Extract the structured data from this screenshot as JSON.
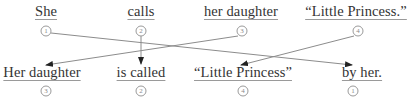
{
  "diagram": {
    "top_row": [
      {
        "text": "She",
        "num": "1",
        "x": 46
      },
      {
        "text": "calls",
        "num": "2",
        "x": 141
      },
      {
        "text": "her daughter",
        "num": "3",
        "x": 241
      },
      {
        "text": "“Little Princess.”",
        "num": "4",
        "x": 356
      }
    ],
    "bottom_row": [
      {
        "text": "Her daughter",
        "num": "3",
        "x": 42
      },
      {
        "text": "is called",
        "num": "2",
        "x": 141
      },
      {
        "text": "“Little Princess”",
        "num": "4",
        "x": 243
      },
      {
        "text": "by her.",
        "num": "1",
        "x": 362
      }
    ],
    "arrows": [
      {
        "from": "1",
        "to": "by her."
      },
      {
        "from": "2",
        "to": "is called"
      },
      {
        "from": "3",
        "to": "Her daughter"
      },
      {
        "from": "4",
        "to": "“Little Princess”"
      }
    ],
    "colors": {
      "text": "#333333",
      "line": "#8c8c8c",
      "arrowhead": "#222222"
    }
  }
}
